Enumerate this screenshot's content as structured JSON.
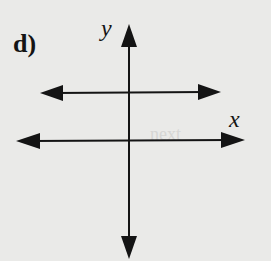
{
  "figure": {
    "part_label": "d)",
    "x_axis_label": "x",
    "y_axis_label": "y",
    "bleed_through_text": "next"
  },
  "colors": {
    "background": "#eaeae8",
    "ink": "#141414"
  },
  "elements": {
    "y_axis": {
      "description": "vertical axis with arrows at both ends"
    },
    "x_axis": {
      "description": "horizontal axis with arrows at both ends"
    },
    "horizontal_line": {
      "description": "horizontal line above the x-axis, arrows at both ends (y = positive constant)"
    }
  }
}
